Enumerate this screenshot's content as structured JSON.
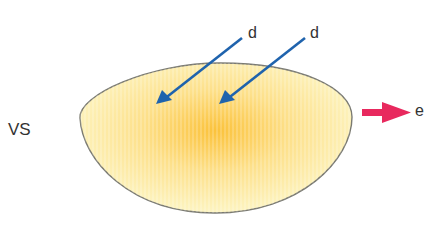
{
  "diagram": {
    "left_label": "VS",
    "input_arrows": [
      {
        "label": "d",
        "color": "#1f63ad"
      },
      {
        "label": "d",
        "color": "#1f63ad"
      }
    ],
    "output_arrow": {
      "label": "e",
      "color": "#e8295e"
    },
    "body": {
      "shape": "bowl",
      "center_color": "#fbc23a",
      "edge_color": "#fdf8cc",
      "outline_color": "#7a7a72"
    }
  }
}
